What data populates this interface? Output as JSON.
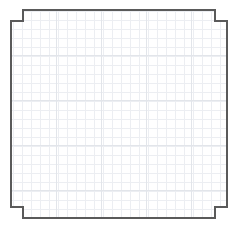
{
  "document": {
    "title": "Grid Canvas",
    "background_color": "#ffffff"
  },
  "canvas": {
    "name": "notched-grid-panel",
    "width": 238,
    "height": 228,
    "fill_color": "#ffffff",
    "border_color": "#5a5a5a",
    "border_width": 1.3,
    "shape": "rounded-rectangle-with-notched-corners",
    "bounds": {
      "left": 11,
      "top": 10,
      "right": 227,
      "bottom": 218
    },
    "notch": {
      "size_x": 12,
      "size_y": 11,
      "corners": [
        "top-left",
        "top-right",
        "bottom-left",
        "bottom-right"
      ]
    },
    "outline_path": "M 23 10 L 215 10 L 215 21 L 227 21 L 227 207 L 215 207 L 215 218 L 23 218 L 23 207 L 11 207 L 11 21 L 23 21 Z"
  },
  "grid": {
    "name": "graph-paper-grid",
    "cell_size": 9,
    "minor_line_color": "#eceef2",
    "minor_line_width": 1,
    "major_line_color": "#e2e5ea",
    "major_line_width": 1,
    "major_every": 5,
    "columns": 24,
    "rows": 23,
    "visible": true
  }
}
